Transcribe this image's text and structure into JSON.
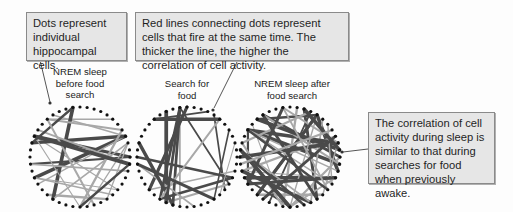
{
  "callouts": {
    "dots": "Dots represent individual hippocampal cells.",
    "lines": "Red lines connecting dots represent cells that fire at the same time. The thicker the line, the higher the correlation of cell activity.",
    "correlation": "The correlation of cell activity during sleep is similar to that during searches for food when previously awake."
  },
  "panels": [
    {
      "label": "NREM sleep before food search"
    },
    {
      "label": "Search for food"
    },
    {
      "label": "NREM sleep after food search"
    }
  ],
  "colors": {
    "box_fill": "#e6e6e6",
    "box_border": "#8a8a8a",
    "line_dark": "#4a4a4a",
    "line_light": "#a8a8a8",
    "dot": "#111111"
  }
}
